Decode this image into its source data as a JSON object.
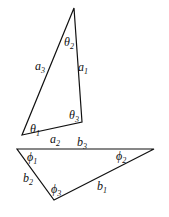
{
  "diagram": {
    "title": "",
    "triangle_a": {
      "vertices": {
        "top": [
          74,
          8
        ],
        "left": [
          22,
          135
        ],
        "right": [
          82,
          122
        ]
      },
      "sides": [
        {
          "base": "a",
          "sub": "1",
          "pos": [
            78,
            71
          ]
        },
        {
          "base": "a",
          "sub": "2",
          "pos": [
            50,
            143
          ]
        },
        {
          "base": "a",
          "sub": "3",
          "pos": [
            35,
            70
          ]
        }
      ],
      "angles": [
        {
          "base": "θ",
          "sub": "1",
          "pos": [
            30,
            133
          ]
        },
        {
          "base": "θ",
          "sub": "2",
          "pos": [
            64,
            46
          ]
        },
        {
          "base": "θ",
          "sub": "3",
          "pos": [
            69,
            119
          ]
        }
      ]
    },
    "triangle_b": {
      "vertices": {
        "left": [
          17,
          149
        ],
        "right": [
          154,
          149
        ],
        "bottom": [
          54,
          200
        ]
      },
      "sides": [
        {
          "base": "b",
          "sub": "1",
          "pos": [
            97,
            190
          ]
        },
        {
          "base": "b",
          "sub": "2",
          "pos": [
            23,
            182
          ]
        },
        {
          "base": "b",
          "sub": "3",
          "pos": [
            77,
            146
          ]
        }
      ],
      "angles": [
        {
          "base": "ϕ",
          "sub": "1",
          "pos": [
            27,
            161
          ]
        },
        {
          "base": "ϕ",
          "sub": "2",
          "pos": [
            116,
            160
          ]
        },
        {
          "base": "ϕ",
          "sub": "3",
          "pos": [
            51,
            193
          ]
        }
      ]
    }
  }
}
